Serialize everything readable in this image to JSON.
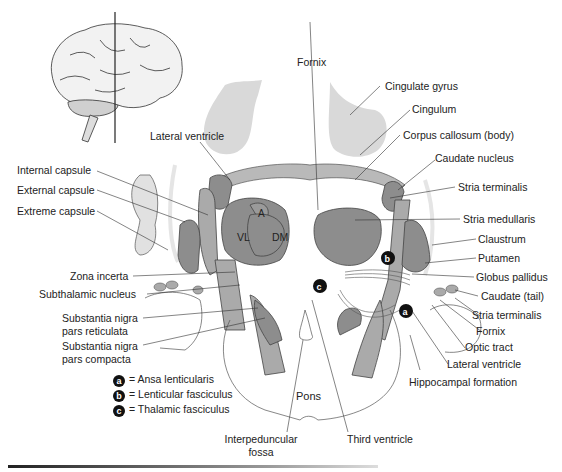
{
  "figure": {
    "colors": {
      "dark_gray": "#8a8a8a",
      "mid_gray": "#a9a9a9",
      "light_gray": "#d9d9d9",
      "outline": "#333333",
      "badge": "#111111"
    }
  },
  "inset": {
    "name": "lateral brain with section line"
  },
  "labels": {
    "fornix_top": "Fornix",
    "cingulate_gyrus": "Cingulate gyrus",
    "cingulum": "Cingulum",
    "lateral_ventricle_top": "Lateral ventricle",
    "corpus_callosum": "Corpus callosum (body)",
    "caudate_nucleus": "Caudate nucleus",
    "internal_capsule": "Internal capsule",
    "external_capsule": "External capsule",
    "extreme_capsule": "Extreme capsule",
    "stria_terminalis_top": "Stria terminalis",
    "stria_medullaris": "Stria medullaris",
    "claustrum": "Claustrum",
    "putamen": "Putamen",
    "globus_pallidus": "Globus pallidus",
    "caudate_tail": "Caudate (tail)",
    "stria_terminalis_bottom": "Stria terminalis",
    "fornix_bottom": "Fornix",
    "optic_tract": "Optic tract",
    "lateral_ventricle_bottom": "Lateral ventricle",
    "hippocampal_formation": "Hippocampal formation",
    "zona_incerta": "Zona incerta",
    "subthalamic_nucleus": "Subthalamic nucleus",
    "sn_reticulata_1": "Substantia nigra",
    "sn_reticulata_2": "pars reticulata",
    "sn_compacta_1": "Substantia nigra",
    "sn_compacta_2": "pars compacta",
    "pons": "Pons",
    "interpeduncular_1": "Interpeduncular",
    "interpeduncular_2": "fossa",
    "third_ventricle": "Third ventricle",
    "thal_vl": "VL",
    "thal_a": "A",
    "thal_dm": "DM"
  },
  "badges": {
    "a": "a",
    "b": "b",
    "c": "c"
  },
  "legend": [
    {
      "key": "a",
      "text": "= Ansa lenticularis"
    },
    {
      "key": "b",
      "text": "= Lenticular fasciculus"
    },
    {
      "key": "c",
      "text": "= Thalamic fasciculus"
    }
  ]
}
